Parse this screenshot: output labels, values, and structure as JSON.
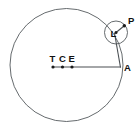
{
  "figure": {
    "kind": "geometric-astronomy-diagram",
    "background_color": "#ffffff",
    "stroke_color": "#555a5e",
    "label_color": "#111111",
    "width": 139,
    "height": 132
  },
  "labels": {
    "terra": "T",
    "center": "C",
    "equant": "E",
    "apogee": "A",
    "epicycle_center": "L",
    "planet": "P"
  },
  "geometry": {
    "deferent": {
      "cx": 66.5,
      "cy": 65.0,
      "r": 56.5
    },
    "epicycle": {
      "cx": 116.0,
      "cy": 32.5,
      "r": 11.5
    },
    "points": {
      "T": {
        "x": 53.0,
        "y": 67.0
      },
      "C": {
        "x": 62.5,
        "y": 67.0
      },
      "E": {
        "x": 72.0,
        "y": 67.0
      },
      "A": {
        "x": 120.0,
        "y": 67.0
      },
      "L": {
        "x": 116.0,
        "y": 32.5
      },
      "P": {
        "x": 124.5,
        "y": 25.5
      }
    },
    "label_offsets": {
      "T": {
        "x": 49.5,
        "y": 62.0
      },
      "C": {
        "x": 59.0,
        "y": 62.0
      },
      "E": {
        "x": 68.5,
        "y": 62.0
      },
      "A": {
        "x": 124.0,
        "y": 70.5
      },
      "L": {
        "x": 110.5,
        "y": 36.5
      },
      "P": {
        "x": 128.0,
        "y": 24.0
      }
    },
    "segments": [
      {
        "name": "apsidal-line",
        "from": "T",
        "to": "A"
      },
      {
        "name": "deferent-radius-to-epicycle",
        "from": "A",
        "to": "L"
      },
      {
        "name": "epicycle-radius-to-planet",
        "from": "L",
        "to": "P"
      }
    ]
  }
}
